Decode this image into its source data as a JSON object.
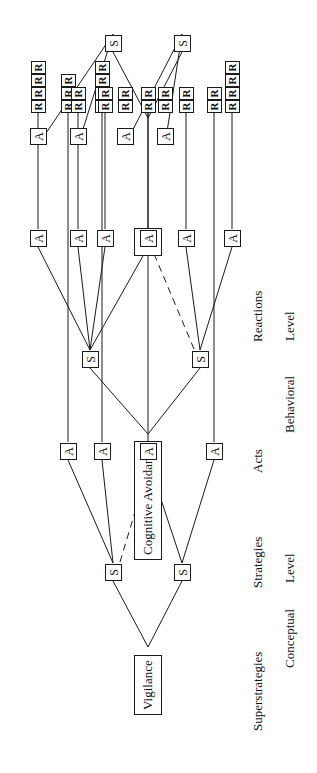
{
  "figure": {
    "row_labels": [
      {
        "id": "superstrategies",
        "text": "Superstrategies"
      },
      {
        "id": "strategies",
        "text": "Strategies"
      },
      {
        "id": "acts",
        "text": "Acts"
      },
      {
        "id": "reactions",
        "text": "Reactions"
      }
    ],
    "level_labels": [
      {
        "id": "conceptual-level",
        "line1": "Conceptual",
        "line2": "Level"
      },
      {
        "id": "behavioral-level",
        "line1": "Behavioral",
        "line2": "Level"
      }
    ],
    "superstrategies": [
      {
        "id": "vigilance",
        "label": "Vigilance"
      },
      {
        "id": "cognitive-avoidance",
        "label": "Cognitive Avoidance"
      },
      {
        "id": "unknown",
        "label": "?"
      }
    ],
    "strategy_label": "S",
    "act_label": "A",
    "reaction_label": "R",
    "strategy_count": 6,
    "act_count": 14,
    "reaction_groups": [
      3,
      4,
      2,
      2,
      4,
      2,
      2,
      2,
      2,
      4,
      2,
      2,
      2,
      2
    ],
    "reaction_total": 35,
    "colors": {
      "background": "#ffffff",
      "stroke": "#1a1a1a",
      "text": "#111111"
    },
    "line_styles": {
      "solid": "solid",
      "dashed": "dashed (cross-link between a strategy and an act of another strategy)"
    },
    "dashed_link_count": 2
  }
}
